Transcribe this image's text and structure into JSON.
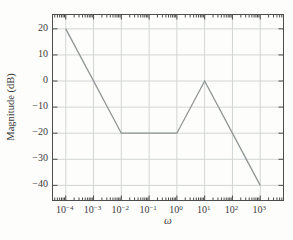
{
  "chart_data": {
    "type": "line",
    "title": "",
    "xlabel": "ω",
    "ylabel": "Magnitude (dB)",
    "x_scale": "log",
    "series": [
      {
        "name": "bode-magnitude-asymptotes",
        "x_log10": [
          -4,
          -2,
          0,
          1,
          3
        ],
        "y_db": [
          20,
          -20,
          -20,
          0,
          -40
        ]
      }
    ],
    "xtick_base": "10",
    "xtick_exponents": [
      -4,
      -3,
      -2,
      -1,
      0,
      1,
      2,
      3
    ],
    "yticks": [
      20,
      10,
      0,
      -10,
      -20,
      -30,
      -40
    ],
    "xlim_log10": [
      -4.46,
      3.82
    ],
    "ylim": [
      -45.6,
      25.3
    ],
    "grid": true,
    "legend": "none",
    "colors": {
      "line": "#8d9493",
      "grid": "#d2d5d5",
      "axis": "#4d4d4d",
      "text": "#3b3b3b",
      "background": "#fdfdfc"
    }
  }
}
